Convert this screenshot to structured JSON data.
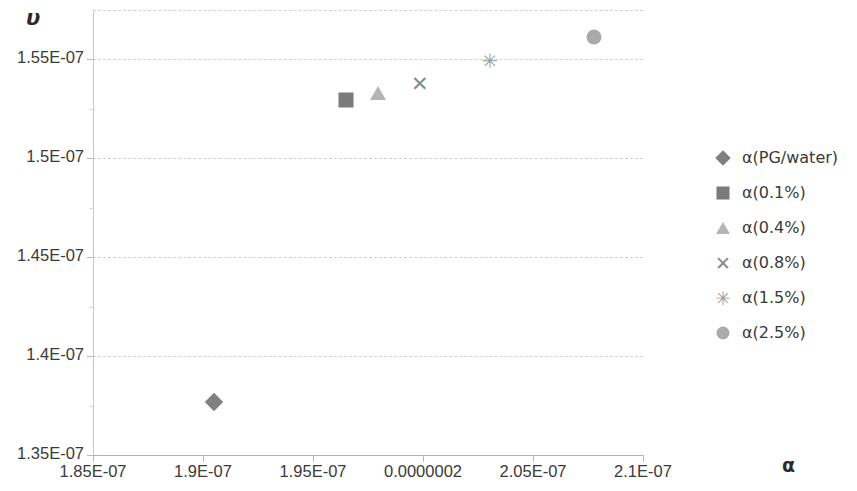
{
  "chart_data": {
    "type": "scatter",
    "title": "",
    "xlabel": "α",
    "ylabel": "υ",
    "xlim": [
      1.85e-07,
      2.1e-07
    ],
    "ylim": [
      1.35e-07,
      1.575e-07
    ],
    "grid": true,
    "legend_position": "right",
    "x_tick_labels": [
      "1.85E-07",
      "1.9E-07",
      "1.95E-07",
      "0.0000002",
      "2.05E-07",
      "2.1E-07"
    ],
    "x_tick_values": [
      1.85e-07,
      1.9e-07,
      1.95e-07,
      2e-07,
      2.05e-07,
      2.1e-07
    ],
    "y_tick_labels": [
      "1.35E-07",
      "1.4E-07",
      "1.45E-07",
      "1.5E-07",
      "1.55E-07"
    ],
    "y_tick_values": [
      1.35e-07,
      1.4e-07,
      1.45e-07,
      1.5e-07,
      1.55e-07
    ],
    "series": [
      {
        "name": "α(PG/water)",
        "marker": "diamond",
        "color": "#808080",
        "points": [
          {
            "x": 1.9048e-07,
            "y": 1.377e-07
          }
        ]
      },
      {
        "name": "α(0.1%)",
        "marker": "square",
        "color": "#7a7a7a",
        "points": [
          {
            "x": 1.965e-07,
            "y": 1.5297e-07
          }
        ]
      },
      {
        "name": "α(0.4%)",
        "marker": "triangle",
        "color": "#b5b5b5",
        "points": [
          {
            "x": 1.9795e-07,
            "y": 1.5331e-07
          }
        ]
      },
      {
        "name": "α(0.8%)",
        "marker": "cross",
        "color": "#8a8a8a",
        "points": [
          {
            "x": 1.9986e-07,
            "y": 1.5376e-07
          }
        ]
      },
      {
        "name": "α(1.5%)",
        "marker": "star",
        "color": "#9f9f9f",
        "points": [
          {
            "x": 2.0304e-07,
            "y": 1.5494e-07
          }
        ]
      },
      {
        "name": "α(2.5%)",
        "marker": "circle",
        "color": "#aaaaaa",
        "points": [
          {
            "x": 2.0777e-07,
            "y": 1.5612e-07
          }
        ]
      }
    ]
  },
  "axes": {
    "y_title": "υ",
    "x_title": "α"
  },
  "legend": {
    "items": [
      {
        "label": "α(PG/water)",
        "marker": "diamond-icon"
      },
      {
        "label": "α(0.1%)",
        "marker": "square-icon"
      },
      {
        "label": "α(0.4%)",
        "marker": "triangle-icon"
      },
      {
        "label": "α(0.8%)",
        "marker": "cross-icon"
      },
      {
        "label": "α(1.5%)",
        "marker": "star-icon"
      },
      {
        "label": "α(2.5%)",
        "marker": "circle-icon"
      }
    ]
  },
  "glyphs": {
    "cross": "✕",
    "star": "✳"
  }
}
